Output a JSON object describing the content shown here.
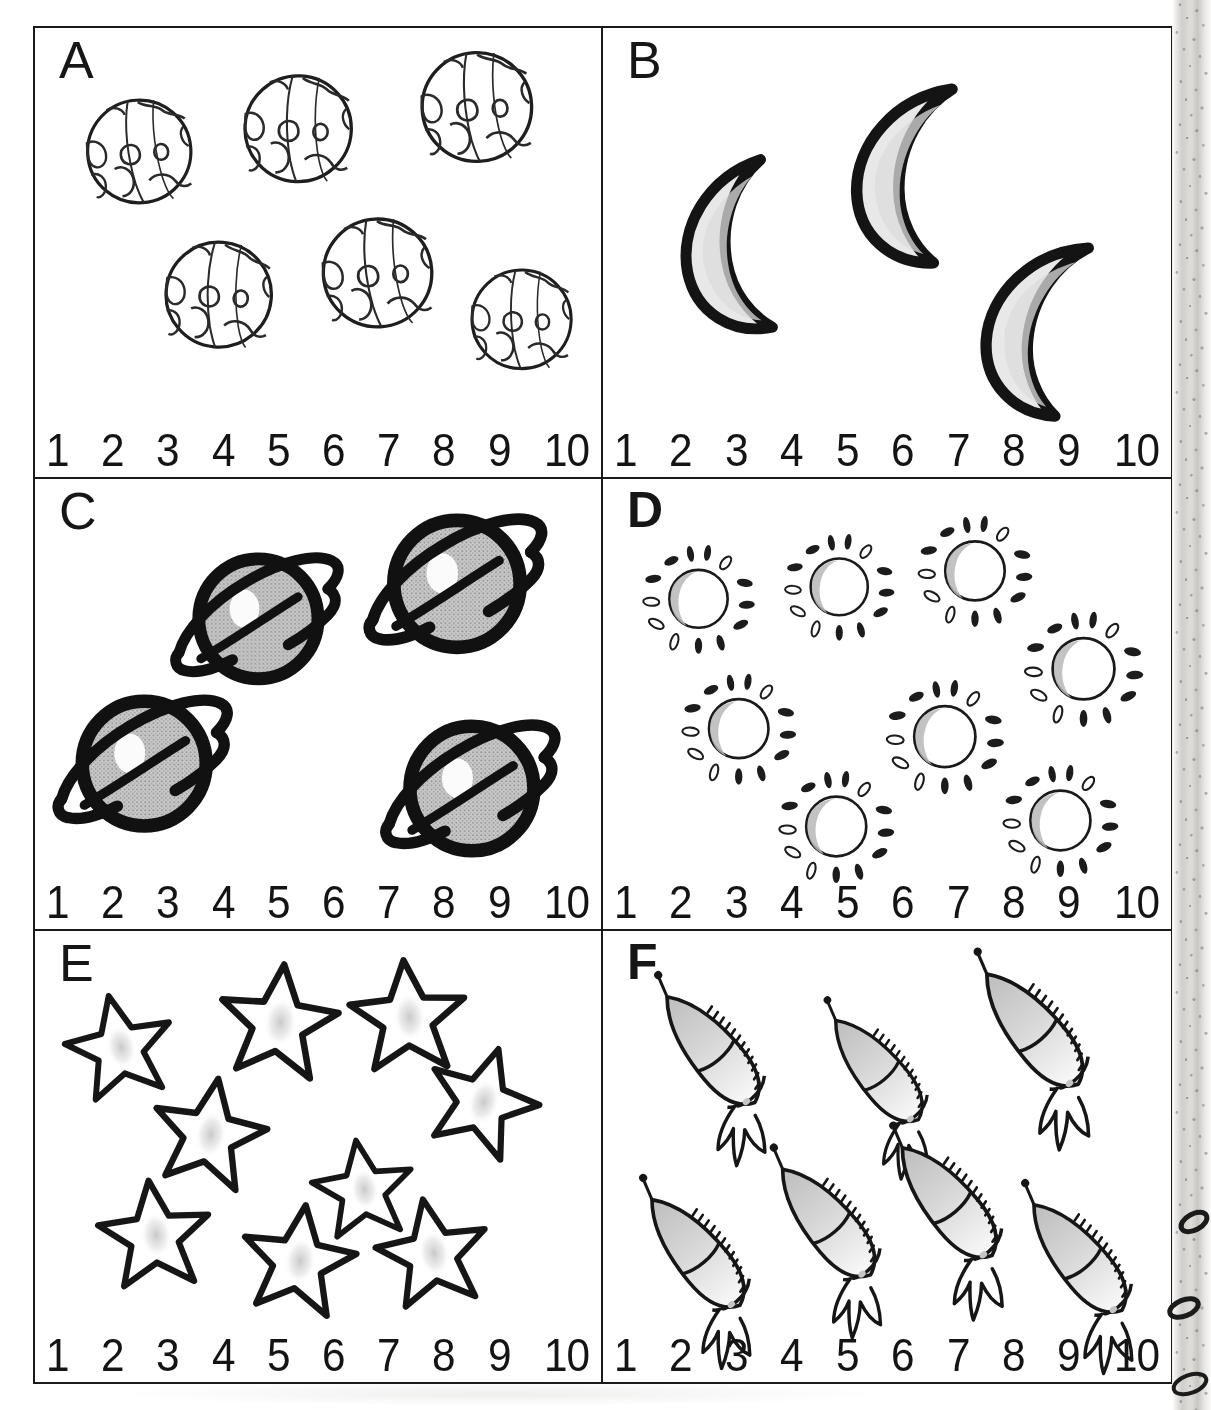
{
  "worksheet": {
    "type": "counting-worksheet",
    "theme": "space",
    "panel_count": 6,
    "number_line": [
      "1",
      "2",
      "3",
      "4",
      "5",
      "6",
      "7",
      "8",
      "9",
      "10"
    ],
    "panels": [
      {
        "letter": "A",
        "object_name": "earth-globe",
        "object_label": "Earth",
        "count": 6,
        "row": 1,
        "col": 1,
        "positions": [
          {
            "x": 9,
            "y": 14,
            "s": 1.0,
            "r": -4
          },
          {
            "x": 37,
            "y": 10,
            "s": 1.03,
            "r": 3
          },
          {
            "x": 66,
            "y": 6,
            "s": 1.06,
            "r": -2
          },
          {
            "x": 23,
            "y": 47,
            "s": 1.02,
            "r": 5
          },
          {
            "x": 51,
            "y": 43,
            "s": 1.05,
            "r": -3
          },
          {
            "x": 74,
            "y": 52,
            "s": 0.96,
            "r": 2
          }
        ]
      },
      {
        "letter": "B",
        "object_name": "crescent-moon",
        "object_label": "Moon",
        "count": 3,
        "row": 1,
        "col": 2,
        "positions": [
          {
            "x": 13,
            "y": 28,
            "s": 1.0,
            "r": -6
          },
          {
            "x": 44,
            "y": 12,
            "s": 1.04,
            "r": 4
          },
          {
            "x": 66,
            "y": 44,
            "s": 1.02,
            "r": 9
          }
        ]
      },
      {
        "letter": "C",
        "object_name": "ringed-planet",
        "object_label": "Saturn",
        "count": 4,
        "row": 2,
        "col": 1,
        "positions": [
          {
            "x": 29,
            "y": 12,
            "s": 1.0,
            "r": 0
          },
          {
            "x": 61,
            "y": 6,
            "s": 1.06,
            "r": 0
          },
          {
            "x": 5,
            "y": 42,
            "s": 1.04,
            "r": 0
          },
          {
            "x": 62,
            "y": 48,
            "s": 1.04,
            "r": 0
          }
        ]
      },
      {
        "letter": "D",
        "object_name": "sun",
        "object_label": "Sun",
        "count": 8,
        "row": 2,
        "col": 2,
        "positions": [
          {
            "x": 5,
            "y": 8,
            "s": 1.0,
            "r": 0
          },
          {
            "x": 28,
            "y": 6,
            "s": 0.98,
            "r": 0
          },
          {
            "x": 50,
            "y": 3,
            "s": 1.02,
            "r": 0
          },
          {
            "x": 69,
            "y": 22,
            "s": 1.06,
            "r": 0
          },
          {
            "x": 10,
            "y": 35,
            "s": 1.02,
            "r": 0
          },
          {
            "x": 44,
            "y": 38,
            "s": 1.05,
            "r": 0
          },
          {
            "x": 26,
            "y": 57,
            "s": 1.03,
            "r": 0
          },
          {
            "x": 63,
            "y": 56,
            "s": 1.03,
            "r": 0
          }
        ]
      },
      {
        "letter": "E",
        "object_name": "star",
        "object_label": "Star",
        "count": 9,
        "row": 3,
        "col": 1,
        "positions": [
          {
            "x": 4,
            "y": 8,
            "s": 1.0,
            "r": -12
          },
          {
            "x": 31,
            "y": 2,
            "s": 1.1,
            "r": 6
          },
          {
            "x": 53,
            "y": 1,
            "s": 1.08,
            "r": -4
          },
          {
            "x": 19,
            "y": 26,
            "s": 1.06,
            "r": 10
          },
          {
            "x": 67,
            "y": 20,
            "s": 1.04,
            "r": 18
          },
          {
            "x": 45,
            "y": 38,
            "s": 0.94,
            "r": -8
          },
          {
            "x": 9,
            "y": 53,
            "s": 1.04,
            "r": -6
          },
          {
            "x": 33,
            "y": 58,
            "s": 1.06,
            "r": 8
          },
          {
            "x": 56,
            "y": 57,
            "s": 1.04,
            "r": -10
          }
        ]
      },
      {
        "letter": "F",
        "object_name": "rocket",
        "object_label": "Rocket",
        "count": 7,
        "row": 3,
        "col": 2,
        "positions": [
          {
            "x": 2,
            "y": 5,
            "s": 1.0,
            "r": 0
          },
          {
            "x": 31,
            "y": 9,
            "s": 0.94,
            "r": 0
          },
          {
            "x": 57,
            "y": 0,
            "s": 1.04,
            "r": 0
          },
          {
            "x": 0,
            "y": 47,
            "s": 1.0,
            "r": 0
          },
          {
            "x": 24,
            "y": 38,
            "s": 1.0,
            "r": 0
          },
          {
            "x": 45,
            "y": 34,
            "s": 1.02,
            "r": 0
          },
          {
            "x": 67,
            "y": 48,
            "s": 1.0,
            "r": 0
          }
        ]
      }
    ]
  },
  "colors": {
    "ink": "#1a1a1a",
    "paper": "#ffffff",
    "gray_fill": "#b9b9b9",
    "light_gray_fill": "#d8d8d8",
    "scan_edge": "#cecccb"
  }
}
